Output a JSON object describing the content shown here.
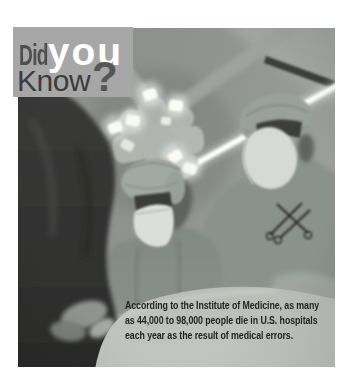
{
  "logo": {
    "did": "Did",
    "you": "you",
    "know": "Know",
    "question_mark": "?",
    "box_color": "#a7a7a7",
    "did_color": "#4f4f4f",
    "you_color": "#ffffff",
    "know_color": "#3c3c3c",
    "question_color": "#565656"
  },
  "caption": {
    "lines": [
      "According to the Institute of Medicine, as many",
      "as 44,000 to 98,000 people die in U.S. hospitals",
      "each year as the result of medical errors."
    ],
    "color": "#242424"
  },
  "photo": {
    "scene": "black-and-white operating room viewed from the patient's perspective: two surgeons in caps and masks, multi-bulb surgical light overhead, fluorescent ceiling tube, draped patient in foreground"
  }
}
